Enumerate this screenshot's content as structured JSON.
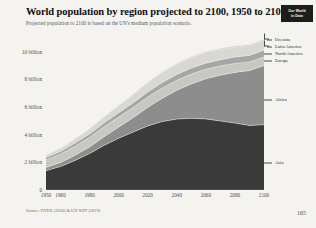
{
  "header": {
    "title": "World population by region projected to 2100, 1950 to 2100",
    "subtitle": "Projected population to 2100 is based on the UN's medium population scenario.",
    "badge_line1": "Our World",
    "badge_line2": "in Data"
  },
  "footer": {
    "source": "Source: HYDE (2016) & UN WPP (2019)",
    "page_number": "165"
  },
  "chart_data": {
    "type": "area",
    "title": "World population by region projected to 2100, 1950 to 2100",
    "subtitle": "Projected population to 2100 is based on the UN's medium population scenario.",
    "stacked": true,
    "xlabel": "",
    "ylabel": "",
    "xlim": [
      1950,
      2100
    ],
    "ylim": [
      0,
      11000000000
    ],
    "grid": false,
    "legend_position": "right",
    "y_ticks": [
      {
        "value": 0,
        "label": "0"
      },
      {
        "value": 2000000000,
        "label": "2 billion"
      },
      {
        "value": 4000000000,
        "label": "4 billion"
      },
      {
        "value": 6000000000,
        "label": "6 billion"
      },
      {
        "value": 8000000000,
        "label": "8 billion"
      },
      {
        "value": 10000000000,
        "label": "10 billion"
      }
    ],
    "x_ticks": [
      {
        "value": 1950,
        "label": "1950"
      },
      {
        "value": 1960,
        "label": "1960"
      },
      {
        "value": 1980,
        "label": "1980"
      },
      {
        "value": 2000,
        "label": "2000"
      },
      {
        "value": 2020,
        "label": "2020"
      },
      {
        "value": 2040,
        "label": "2040"
      },
      {
        "value": 2060,
        "label": "2060"
      },
      {
        "value": 2080,
        "label": "2080"
      },
      {
        "value": 2100,
        "label": "2100"
      }
    ],
    "x": [
      1950,
      1960,
      1970,
      1980,
      1990,
      2000,
      2010,
      2020,
      2030,
      2040,
      2050,
      2060,
      2070,
      2080,
      2090,
      2100
    ],
    "series": [
      {
        "name": "Asia",
        "color": "#3a3a3a",
        "values": [
          1.4,
          1.7,
          2.14,
          2.64,
          3.23,
          3.74,
          4.19,
          4.64,
          4.95,
          5.13,
          5.19,
          5.14,
          5.0,
          4.84,
          4.67,
          4.72
        ]
      },
      {
        "name": "Africa",
        "color": "#8d8d8d",
        "values": [
          0.23,
          0.28,
          0.37,
          0.48,
          0.63,
          0.81,
          1.04,
          1.34,
          1.69,
          2.08,
          2.49,
          2.91,
          3.31,
          3.67,
          3.97,
          4.28
        ]
      },
      {
        "name": "Europe",
        "color": "#c9c7c2",
        "values": [
          0.55,
          0.61,
          0.66,
          0.69,
          0.72,
          0.73,
          0.74,
          0.75,
          0.74,
          0.73,
          0.71,
          0.69,
          0.67,
          0.65,
          0.63,
          0.63
        ]
      },
      {
        "name": "North America",
        "color": "#a6a6a6",
        "values": [
          0.17,
          0.2,
          0.23,
          0.25,
          0.28,
          0.31,
          0.34,
          0.37,
          0.4,
          0.42,
          0.43,
          0.44,
          0.45,
          0.46,
          0.47,
          0.49
        ]
      },
      {
        "name": "Latin America",
        "color": "#d9d7d2",
        "values": [
          0.17,
          0.22,
          0.29,
          0.36,
          0.44,
          0.52,
          0.59,
          0.65,
          0.71,
          0.75,
          0.76,
          0.76,
          0.75,
          0.73,
          0.7,
          0.68
        ]
      },
      {
        "name": "Oceania",
        "color": "#bdbbb6",
        "values": [
          0.013,
          0.016,
          0.02,
          0.023,
          0.027,
          0.031,
          0.037,
          0.043,
          0.048,
          0.053,
          0.057,
          0.061,
          0.064,
          0.067,
          0.07,
          0.072
        ]
      }
    ],
    "legend": [
      {
        "label": "Oceania",
        "color": "#bdbbb6"
      },
      {
        "label": "Latin America",
        "color": "#d9d7d2"
      },
      {
        "label": "North America",
        "color": "#a6a6a6"
      },
      {
        "label": "Europe",
        "color": "#c9c7c2"
      },
      {
        "label": "Africa",
        "color": "#8d8d8d"
      },
      {
        "label": "Asia",
        "color": "#3a3a3a"
      }
    ]
  }
}
